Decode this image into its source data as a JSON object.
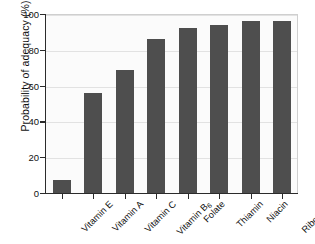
{
  "chart_data": {
    "type": "bar",
    "title": "",
    "xlabel": "",
    "ylabel": "Probability of adequacy (%)",
    "ylim": [
      0,
      100
    ],
    "ytick_labels": [
      "0",
      "20",
      "40",
      "60",
      "80",
      "100"
    ],
    "ytick_values": [
      0,
      20,
      40,
      60,
      80,
      100
    ],
    "grid": "horizontal",
    "legend": "none",
    "bar_color": "#4e4e4e",
    "plot_background": "#fbfbfb",
    "axis_color": "#2b2b2b",
    "categories": [
      "Vitamin E",
      "Vitamin A",
      "Vitamin C",
      "Vitamin B6",
      "Folate",
      "Thiamin",
      "Niacin",
      "Riboflavin"
    ],
    "category_labels_html": [
      "Vitamin E",
      "Vitamin A",
      "Vitamin C",
      "Vitamin B<sub>6</sub>",
      "Folate",
      "Thiamin",
      "Niacin",
      "Riboflavin"
    ],
    "values": [
      7,
      56,
      69,
      86,
      92,
      94,
      96,
      96
    ]
  },
  "caption": {
    "text": ""
  }
}
